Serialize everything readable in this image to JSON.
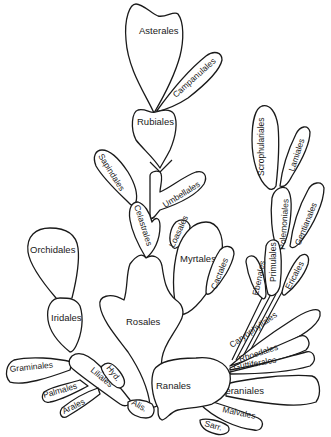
{
  "diagram": {
    "type": "phylogenetic bubble diagram (angiosperm orders)",
    "colors": {
      "stroke": "#1a1a1a",
      "fill": "#ffffff",
      "background": "#ffffff"
    },
    "orders": {
      "asterales": "Asterales",
      "campanulales": "Campanulales",
      "rubiales": "Rubiales",
      "sapindales": "Sapindales",
      "umbellales": "Umbellales",
      "celastrales": "Celastrales",
      "loasales": "Loasales",
      "myrtales": "Myrtales",
      "cactales": "Cactales",
      "rosales": "Rosales",
      "scrophulariales": "Scrophulariales",
      "lamiales": "Lamiales",
      "polemoniales": "Polemoniales",
      "gentianales": "Gentianales",
      "primulales": "Primulales",
      "ebenales": "Ebenales",
      "ericales": "Ericales",
      "caryophyllales": "Caryophyllales",
      "rhoedales": "Rhoedales",
      "guttiferales": "Guttiferales",
      "geraniales": "Geraniales",
      "malvales": "Malvales",
      "sarr": "Sarr.",
      "ranales": "Ranales",
      "orchidales": "Orchidales",
      "iridales": "Iridales",
      "graminales": "Graminales",
      "palmales": "Palmales",
      "arales": "Arales",
      "liliales": "Liliales",
      "hyd": "Hyd.",
      "alis": "Alis."
    }
  }
}
